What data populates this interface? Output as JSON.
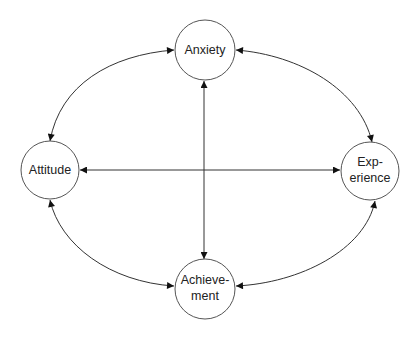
{
  "diagram": {
    "nodes": [
      {
        "id": "anxiety",
        "lines": [
          "Anxiety"
        ]
      },
      {
        "id": "attitude",
        "lines": [
          "Attitude"
        ]
      },
      {
        "id": "experience",
        "lines": [
          "Exp-",
          "erience"
        ]
      },
      {
        "id": "achievement",
        "lines": [
          "Achieve-",
          "ment"
        ]
      }
    ],
    "edges": [
      {
        "from": "anxiety",
        "to": "attitude",
        "direction": "bidirectional"
      },
      {
        "from": "anxiety",
        "to": "experience",
        "direction": "bidirectional"
      },
      {
        "from": "attitude",
        "to": "achievement",
        "direction": "bidirectional"
      },
      {
        "from": "experience",
        "to": "achievement",
        "direction": "bidirectional"
      },
      {
        "from": "attitude",
        "to": "experience",
        "direction": "bidirectional"
      },
      {
        "from": "anxiety",
        "to": "achievement",
        "direction": "bidirectional"
      }
    ],
    "colors": {
      "stroke": "#333333",
      "background": "#ffffff"
    }
  }
}
